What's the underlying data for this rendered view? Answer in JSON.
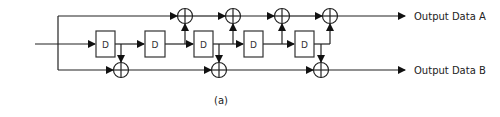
{
  "diagram": {
    "type": "convolutional-encoder",
    "delay_label": "D",
    "delay_count": 5,
    "outputs": {
      "a_label": "Output Data A",
      "b_label": "Output Data B"
    },
    "caption": "(a)",
    "colors": {
      "line": "#222222",
      "background": "#ffffff"
    }
  }
}
